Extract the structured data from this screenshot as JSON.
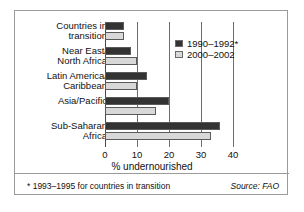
{
  "chart_data": {
    "type": "bar",
    "orientation": "horizontal",
    "title": "",
    "xlabel": "% undernourished",
    "ylabel": "",
    "xlim": [
      0,
      40
    ],
    "xticks": [
      0,
      10,
      20,
      30,
      40
    ],
    "xtick_labels": [
      "0",
      "10",
      "20",
      "30",
      "40"
    ],
    "grid": true,
    "legend_position": "upper right",
    "categories": [
      "Countries in\ntransition",
      "Near East/\nNorth Africa",
      "Latin America/\nCaribbean",
      "Asia/Pacific",
      "Sub-Saharan\nAfrica"
    ],
    "series": [
      {
        "name": "1990–1992*",
        "color": "#333333",
        "values": [
          6,
          8,
          13,
          20,
          36
        ]
      },
      {
        "name": "2000–2002",
        "color": "#d8d8d8",
        "values": [
          6,
          10,
          10,
          16,
          33
        ]
      }
    ],
    "footnote": "* 1993–1995 for countries in transition",
    "source": "Source: FAO"
  },
  "colors": {
    "series_1990": "#333333",
    "series_2000": "#d8d8d8",
    "frame": "#9a9a9a",
    "gridline": "#6e6e6e",
    "text": "#111111",
    "background": "#ffffff"
  }
}
